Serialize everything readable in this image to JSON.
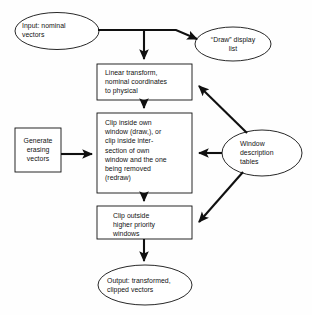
{
  "figure": {
    "kind": "flowchart",
    "stroke_color": "#101010",
    "fill_color": "#ffffff",
    "background_color": "#fefefe"
  },
  "nodes": {
    "input_vectors": {
      "shape": "ellipse",
      "label": "Input: nominal\nvectors"
    },
    "draw_display_list": {
      "shape": "ellipse",
      "label": "“Draw” display\nlist"
    },
    "linear_transform": {
      "shape": "rectangle",
      "label": "Linear transform,\nnominal coordinates\nto physical"
    },
    "clip_inside": {
      "shape": "rectangle",
      "label": "Clip inside own\nwindow (draw,), or\nclip inside inter-\nsection of own\nwindow and the one\nbeing removed\n(redraw)"
    },
    "generate_erasing": {
      "shape": "rectangle",
      "label": "Generate\nerasing\nvectors"
    },
    "window_tables": {
      "shape": "ellipse",
      "label": "Window\ndescription\ntables"
    },
    "clip_outside": {
      "shape": "rectangle",
      "label": "Clip outside\nhigher priority\nwindows"
    },
    "output_vectors": {
      "shape": "ellipse",
      "label": "Output: transformed,\nclipped vectors"
    }
  },
  "edges": [
    {
      "from": "input_vectors",
      "to": "draw_display_list",
      "style": "orthogonal-then-diagonal"
    },
    {
      "from": "input_vectors",
      "to": "linear_transform",
      "style": "orthogonal-branch-down"
    },
    {
      "from": "linear_transform",
      "to": "clip_inside",
      "style": "straight-down"
    },
    {
      "from": "clip_inside",
      "to": "clip_outside",
      "style": "straight-down"
    },
    {
      "from": "clip_outside",
      "to": "output_vectors",
      "style": "straight-down"
    },
    {
      "from": "generate_erasing",
      "to": "clip_inside",
      "style": "straight-right"
    },
    {
      "from": "window_tables",
      "to": "linear_transform",
      "style": "diagonal-up-left"
    },
    {
      "from": "window_tables",
      "to": "clip_inside",
      "style": "straight-left"
    },
    {
      "from": "window_tables",
      "to": "clip_outside",
      "style": "diagonal-down-left"
    }
  ]
}
